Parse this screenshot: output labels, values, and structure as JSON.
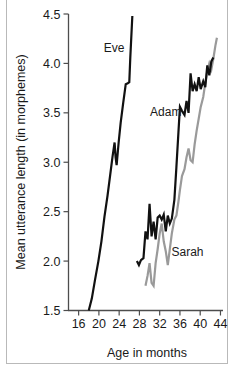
{
  "chart_data": {
    "type": "line",
    "title": "",
    "xlabel": "Age in months",
    "ylabel": "Mean utterance length (in morphemes)",
    "xlim": [
      14,
      44.5
    ],
    "ylim": [
      1.5,
      4.5
    ],
    "xticks": [
      16,
      20,
      24,
      28,
      32,
      36,
      40,
      44
    ],
    "xtick_labels": [
      "16",
      "20",
      "24",
      "28",
      "32",
      "36",
      "40",
      "44"
    ],
    "yticks": [
      1.5,
      2.0,
      2.5,
      3.0,
      3.5,
      4.0,
      4.5
    ],
    "ytick_labels": [
      "1.5",
      "2.0",
      "2.5",
      "3.0",
      "3.5",
      "4.0",
      "4.5"
    ],
    "grid": false,
    "legend_position": "inline-annotations",
    "series": [
      {
        "name": "Eve",
        "color": "#111111",
        "width": 2.2,
        "label_x": 23.0,
        "label_y": 4.12,
        "x": [
          18.0,
          18.6,
          19.2,
          19.9,
          20.5,
          21.1,
          21.7,
          22.2,
          22.7,
          23.1,
          23.3,
          23.5,
          23.9,
          24.3,
          24.8,
          25.3,
          25.7,
          26.0,
          26.2,
          26.6
        ],
        "y": [
          1.5,
          1.62,
          1.8,
          2.0,
          2.2,
          2.45,
          2.66,
          2.86,
          3.06,
          3.2,
          3.05,
          2.97,
          3.2,
          3.4,
          3.6,
          3.79,
          3.8,
          3.81,
          4.06,
          4.48
        ]
      },
      {
        "name": "Adam",
        "color": "#111111",
        "width": 2.2,
        "label_x": 33.2,
        "label_y": 3.47,
        "x": [
          27.5,
          27.9,
          28.3,
          28.8,
          29.2,
          29.6,
          30.0,
          30.4,
          30.8,
          31.2,
          31.6,
          32.0,
          32.4,
          32.8,
          33.2,
          33.6,
          34.0,
          34.4,
          34.9,
          35.3,
          35.7,
          36.0,
          36.4,
          36.9,
          37.3,
          37.7,
          38.1,
          38.5,
          38.9,
          39.3,
          39.7,
          40.1,
          40.6,
          41.0,
          41.4,
          41.8,
          42.2,
          42.6
        ],
        "y": [
          2.0,
          1.96,
          2.01,
          2.03,
          2.3,
          2.22,
          2.58,
          2.25,
          2.4,
          2.22,
          2.44,
          2.46,
          2.42,
          2.47,
          2.3,
          2.46,
          2.38,
          2.43,
          2.62,
          2.95,
          3.3,
          3.56,
          3.52,
          3.48,
          3.62,
          3.5,
          3.9,
          3.72,
          3.79,
          3.72,
          3.86,
          3.74,
          3.82,
          3.76,
          3.98,
          3.88,
          4.02,
          4.06
        ]
      },
      {
        "name": "Sarah",
        "color": "#9a9a9a",
        "width": 2.2,
        "label_x": 37.5,
        "label_y": 2.05,
        "x": [
          29.2,
          29.6,
          30.0,
          30.4,
          30.8,
          31.2,
          31.6,
          32.0,
          32.4,
          32.8,
          33.2,
          33.6,
          34.0,
          34.4,
          34.9,
          35.3,
          35.7,
          36.0,
          36.4,
          36.9,
          37.3,
          37.7,
          38.1,
          38.5,
          38.9,
          39.3,
          39.7,
          40.1,
          40.6,
          41.0,
          41.4,
          41.8,
          42.2,
          42.6,
          43.0,
          43.3
        ],
        "y": [
          1.75,
          1.85,
          1.98,
          1.78,
          1.75,
          1.98,
          2.12,
          2.28,
          2.38,
          2.2,
          2.1,
          1.96,
          2.12,
          2.28,
          2.42,
          2.46,
          2.6,
          2.72,
          2.86,
          2.93,
          3.05,
          3.14,
          3.02,
          3.0,
          3.18,
          3.32,
          3.44,
          3.56,
          3.66,
          3.8,
          3.92,
          4.0,
          3.94,
          4.05,
          4.18,
          4.26
        ]
      }
    ]
  },
  "figure": {
    "axis_color": "#4d4d4d",
    "frame_color": "#b9b9b9",
    "background": "#ffffff"
  }
}
